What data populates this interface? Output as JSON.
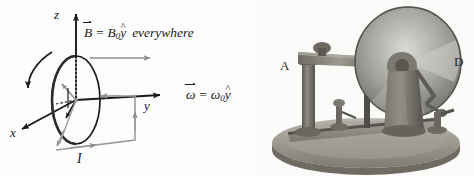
{
  "figure": {
    "kind": "physics-figure",
    "background": "#fdfdfd",
    "ink": "#1a1a1a",
    "accent_gray": "#8c8c8c"
  },
  "diagram": {
    "axes": [
      {
        "name": "z",
        "label": "z",
        "direction": "up"
      },
      {
        "name": "y",
        "label": "y",
        "direction": "right"
      },
      {
        "name": "x",
        "label": "x",
        "direction": "down-left"
      }
    ],
    "current_label": "I",
    "equations": {
      "b_field": {
        "vector": "B",
        "equals": "=",
        "magnitude": "B",
        "subscript": "0",
        "unit": "y",
        "hat": "^",
        "qualifier": "everywhere",
        "plain": "B⃗ = B₀ŷ everywhere"
      },
      "omega": {
        "vector": "ω",
        "equals": "=",
        "magnitude": "ω",
        "subscript": "0",
        "unit": "y",
        "hat": "^",
        "plain": "ω⃗ = ω₀ŷ"
      }
    },
    "annotations": {
      "rotation_arrow": "curved-rotation-arrow",
      "b_field_arrow": "field-direction-arrow",
      "disk": "rotating-conducting-disk",
      "circuit": "current-return-circuit"
    }
  },
  "photo": {
    "caption_labels": [
      {
        "name": "A",
        "text": "A"
      },
      {
        "name": "D",
        "text": "D"
      }
    ],
    "subject": "faraday-disk-dynamo-apparatus",
    "parts": {
      "disk": "metal-disk",
      "base": "wooden-base",
      "post": "support-post",
      "arm": "upper-arm",
      "terminal": "binding-post"
    }
  }
}
